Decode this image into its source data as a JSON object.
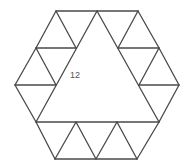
{
  "figure": {
    "label": "12",
    "label_position": {
      "x": 70,
      "y": 78
    },
    "line_color": "#4a4a4a",
    "label_color": "#555555",
    "points": {
      "hex_top_left": [
        56,
        11
      ],
      "top_mid": [
        97,
        11
      ],
      "hex_top_right": [
        138,
        11
      ],
      "hex_right": [
        179,
        85
      ],
      "hex_bottom_right": [
        137,
        159
      ],
      "bottom_mid_right": [
        96,
        159
      ],
      "hex_bottom_left": [
        55,
        159
      ],
      "hex_left": [
        15,
        85
      ],
      "upper_left_outer": [
        36,
        48
      ],
      "upper_left_inner": [
        76,
        48
      ],
      "upper_right_inner": [
        118,
        48
      ],
      "upper_right_outer": [
        159,
        48
      ],
      "mid_left_inner": [
        56,
        85
      ],
      "mid_right_inner": [
        139,
        85
      ],
      "base_left": [
        36,
        122
      ],
      "base_p1": [
        76,
        122
      ],
      "base_p2": [
        117,
        122
      ],
      "base_right": [
        159,
        122
      ]
    },
    "segments": [
      [
        [
          56,
          11
        ],
        [
          138,
          11
        ]
      ],
      [
        [
          56,
          11
        ],
        [
          36,
          48
        ]
      ],
      [
        [
          56,
          11
        ],
        [
          76,
          48
        ]
      ],
      [
        [
          36,
          48
        ],
        [
          76,
          48
        ]
      ],
      [
        [
          36,
          48
        ],
        [
          15,
          85
        ]
      ],
      [
        [
          36,
          48
        ],
        [
          56,
          85
        ]
      ],
      [
        [
          15,
          85
        ],
        [
          56,
          85
        ]
      ],
      [
        [
          15,
          85
        ],
        [
          36,
          122
        ]
      ],
      [
        [
          97,
          11
        ],
        [
          36,
          122
        ]
      ],
      [
        [
          97,
          11
        ],
        [
          159,
          122
        ]
      ],
      [
        [
          138,
          11
        ],
        [
          118,
          48
        ]
      ],
      [
        [
          138,
          11
        ],
        [
          159,
          48
        ]
      ],
      [
        [
          118,
          48
        ],
        [
          159,
          48
        ]
      ],
      [
        [
          159,
          48
        ],
        [
          139,
          85
        ]
      ],
      [
        [
          159,
          48
        ],
        [
          179,
          85
        ]
      ],
      [
        [
          139,
          85
        ],
        [
          179,
          85
        ]
      ],
      [
        [
          179,
          85
        ],
        [
          159,
          122
        ]
      ],
      [
        [
          36,
          122
        ],
        [
          159,
          122
        ]
      ],
      [
        [
          36,
          122
        ],
        [
          55,
          159
        ]
      ],
      [
        [
          55,
          159
        ],
        [
          76,
          122
        ]
      ],
      [
        [
          76,
          122
        ],
        [
          96,
          159
        ]
      ],
      [
        [
          96,
          159
        ],
        [
          117,
          122
        ]
      ],
      [
        [
          117,
          122
        ],
        [
          137,
          159
        ]
      ],
      [
        [
          137,
          159
        ],
        [
          159,
          122
        ]
      ],
      [
        [
          55,
          159
        ],
        [
          137,
          159
        ]
      ]
    ]
  }
}
